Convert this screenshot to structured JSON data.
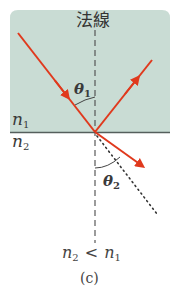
{
  "diagram": {
    "type": "refraction-reflection",
    "colors": {
      "medium1_fill": "#c9dcd4",
      "boundary_line": "#555f5c",
      "ray": "#e0391d",
      "normal_line": "#4a4a4a",
      "dotted_extension": "#333333",
      "text": "#3a3a3a"
    },
    "labels": {
      "normal": "法線",
      "n1": "n",
      "n1_sub": "1",
      "n2": "n",
      "n2_sub": "2",
      "theta1": "θ",
      "theta1_sub": "1",
      "theta2": "θ",
      "theta2_sub": "2",
      "relation_left": "n",
      "relation_left_sub": "2",
      "relation_op": "<",
      "relation_right": "n",
      "relation_right_sub": "1",
      "caption": "(c)"
    },
    "rays": [
      {
        "name": "incident",
        "from": [
          18,
          33
        ],
        "to": [
          95,
          132
        ]
      },
      {
        "name": "reflected",
        "from": [
          95,
          132
        ],
        "to": [
          152,
          60
        ]
      },
      {
        "name": "refracted",
        "from": [
          95,
          132
        ],
        "to": [
          145,
          168
        ]
      }
    ]
  }
}
